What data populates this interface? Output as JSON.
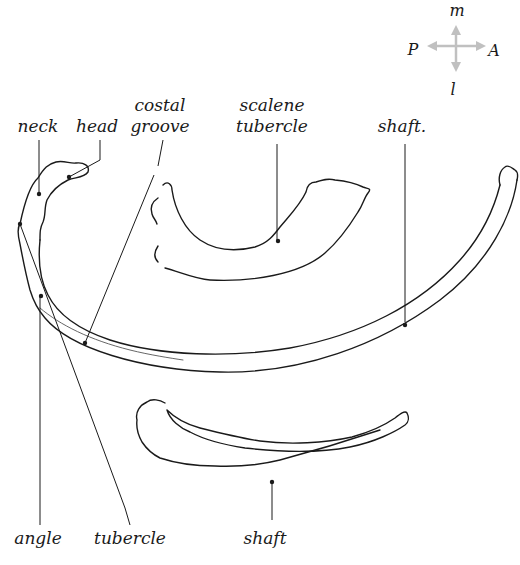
{
  "figure": {
    "line_color": "#1a1a1a",
    "compass_color": "#c0c0c0"
  },
  "compass": {
    "top": "m",
    "bottom": "l",
    "left": "P",
    "right": "A"
  },
  "labels": {
    "neck": "neck",
    "head": "head",
    "costal_groove_1": "costal",
    "costal_groove_2": "groove",
    "scalene_tubercle_1": "scalene",
    "scalene_tubercle_2": "tubercle",
    "shaft_typical": "shaft.",
    "angle": "angle",
    "tubercle": "tubercle",
    "shaft_12th": "shaft"
  },
  "structures": [
    {
      "name": "typical rib",
      "parts": [
        "head",
        "neck",
        "tubercle",
        "angle",
        "costal groove",
        "shaft"
      ]
    },
    {
      "name": "first rib",
      "parts": [
        "scalene tubercle"
      ]
    },
    {
      "name": "twelfth rib",
      "parts": [
        "shaft"
      ]
    }
  ]
}
